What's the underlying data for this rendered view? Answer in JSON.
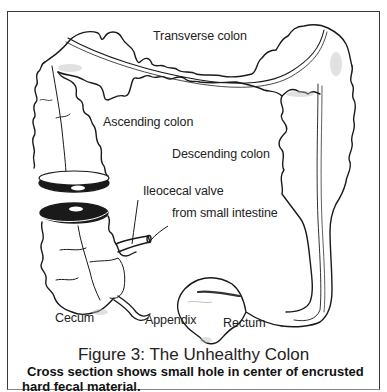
{
  "figure": {
    "title": "Figure 3: The Unhealthy Colon",
    "caption_line1": "Cross section shows small hole in center of encrusted",
    "caption_line2": "hard fecal material."
  },
  "labels": {
    "transverse_colon": "Transverse colon",
    "ascending_colon": "Ascending colon",
    "descending_colon": "Descending colon",
    "ileocecal_valve": "Ileocecal valve",
    "from_small_intestine": "from small intestine",
    "cecum": "Cecum",
    "appendix": "Appendix",
    "rectum": "Rectum"
  },
  "colors": {
    "ink": "#1a1a1a",
    "background": "#ffffff",
    "frame": "#3a3a3a"
  }
}
